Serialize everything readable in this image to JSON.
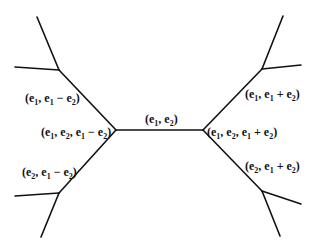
{
  "diagram": {
    "type": "tree-graph",
    "edge_color": "#111111",
    "nodes": [
      {
        "id": "L",
        "x": 116,
        "y": 130
      },
      {
        "id": "R",
        "x": 203,
        "y": 130
      },
      {
        "id": "TL",
        "x": 59,
        "y": 70
      },
      {
        "id": "BL",
        "x": 59,
        "y": 193
      },
      {
        "id": "TR",
        "x": 262,
        "y": 69
      },
      {
        "id": "BR",
        "x": 262,
        "y": 191
      }
    ],
    "edges": [
      {
        "from": [
          116,
          130
        ],
        "to": [
          203,
          130
        ]
      },
      {
        "from": [
          116,
          130
        ],
        "to": [
          59,
          70
        ]
      },
      {
        "from": [
          116,
          130
        ],
        "to": [
          59,
          193
        ]
      },
      {
        "from": [
          203,
          130
        ],
        "to": [
          262,
          69
        ]
      },
      {
        "from": [
          203,
          130
        ],
        "to": [
          262,
          191
        ]
      },
      {
        "from": [
          59,
          70
        ],
        "to": [
          37,
          17
        ]
      },
      {
        "from": [
          59,
          70
        ],
        "to": [
          15,
          67
        ]
      },
      {
        "from": [
          59,
          193
        ],
        "to": [
          15,
          196
        ]
      },
      {
        "from": [
          59,
          193
        ],
        "to": [
          41,
          237
        ]
      },
      {
        "from": [
          262,
          69
        ],
        "to": [
          283,
          16
        ]
      },
      {
        "from": [
          262,
          69
        ],
        "to": [
          301,
          65
        ]
      },
      {
        "from": [
          262,
          191
        ],
        "to": [
          301,
          204
        ]
      },
      {
        "from": [
          262,
          191
        ],
        "to": [
          280,
          236
        ]
      }
    ],
    "labels": {
      "center_edge": "(e1,e2)",
      "left_vertex": "(e1,e2,e1−e2)",
      "right_vertex": "(e1,e2,e1+e2)",
      "upper_left_edge": "(e1,e1−e2)",
      "lower_left_edge": "(e2,e1−e2)",
      "upper_right_edge": "(e1,e1+e2)",
      "lower_right_edge": "(e2,e1+e2)"
    }
  }
}
